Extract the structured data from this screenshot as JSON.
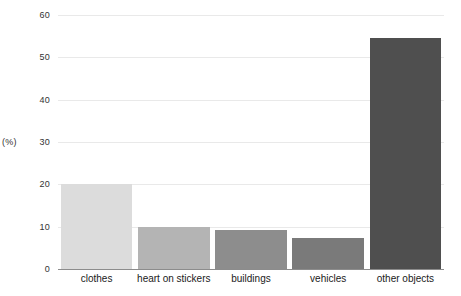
{
  "chart_data": {
    "type": "bar",
    "title": "",
    "subtitle": "",
    "xlabel": "",
    "ylabel": "(%)",
    "ylim": [
      0,
      60
    ],
    "yticks": [
      0,
      10,
      20,
      30,
      40,
      50,
      60
    ],
    "ytick_labels": [
      "0",
      "10",
      "20",
      "30",
      "40",
      "50",
      "60"
    ],
    "grid": true,
    "legend": "none",
    "categories": [
      "clothes",
      "heart on stickers",
      "buildings",
      "vehicles",
      "other objects"
    ],
    "values": [
      20.0,
      10.0,
      9.3,
      7.3,
      54.5
    ],
    "bar_colors": [
      "#dcdcdc",
      "#b4b4b4",
      "#8d8d8d",
      "#7a7a7a",
      "#4f4f4f"
    ],
    "axis_color": "#8c8c8c",
    "grid_color": "#e9e9e9",
    "text_color": "#333333",
    "background": "#ffffff"
  }
}
